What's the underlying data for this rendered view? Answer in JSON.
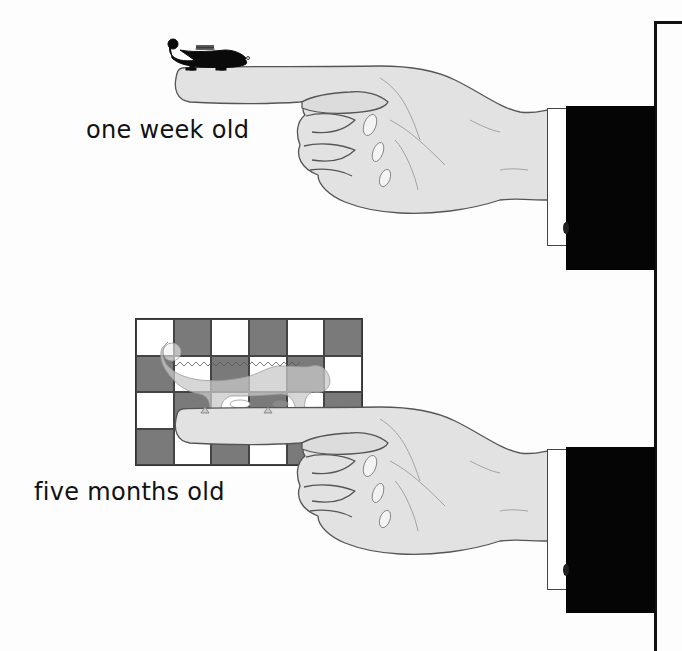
{
  "labels": {
    "top": "one week old",
    "bottom": "five months old"
  },
  "scenes": [
    {
      "id": "week-old",
      "caption": "one week old",
      "animal": "chameleon",
      "animal_color": "#0a0a0a",
      "background": "plain"
    },
    {
      "id": "five-months-old",
      "caption": "five months old",
      "animal": "chameleon",
      "animal_style": "translucent-outline",
      "background": "checkerboard",
      "checkerboard": {
        "columns": 6,
        "rows": 4,
        "dark_color": "#7a7a7a",
        "light_color": "#ffffff",
        "pattern": [
          [
            "light",
            "dark",
            "light",
            "dark",
            "light",
            "dark"
          ],
          [
            "dark",
            "light",
            "dark",
            "light",
            "dark",
            "light"
          ],
          [
            "light",
            "dark",
            "light",
            "dark",
            "light",
            "dark"
          ],
          [
            "dark",
            "light",
            "dark",
            "light",
            "dark",
            "light"
          ]
        ]
      }
    }
  ],
  "colors": {
    "hand_fill": "#e2e2e2",
    "hand_outline": "#555555",
    "sleeve": "#050505",
    "cuff": "#ffffff",
    "frame_line": "#111111"
  }
}
